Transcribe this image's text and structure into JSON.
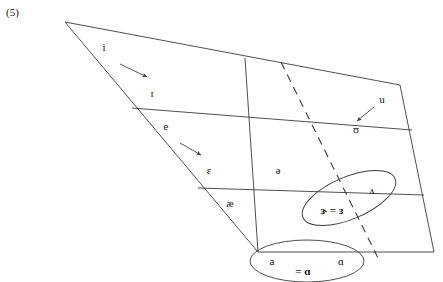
{
  "page": {
    "example_number": "(5)",
    "background_color": "#ffffff",
    "ink_color": "#333333",
    "width": 443,
    "height": 282
  },
  "diagram": {
    "type": "vowel-quadrilateral",
    "outline": {
      "top_left": [
        65,
        22
      ],
      "top_right": [
        400,
        85
      ],
      "bottom_right": [
        434,
        252
      ],
      "bottom_left": [
        258,
        252
      ]
    },
    "horizontal_lines": [
      {
        "name": "high-mid-line",
        "from": [
          132,
          108
        ],
        "to": [
          412,
          130
        ]
      },
      {
        "name": "mid-low-line",
        "from": [
          198,
          188
        ],
        "to": [
          424,
          195
        ]
      }
    ],
    "vertical_lines": [
      {
        "name": "central-line",
        "from": [
          245,
          58
        ],
        "to": [
          258,
          252
        ],
        "style": "solid"
      },
      {
        "name": "back-line",
        "from": [
          281,
          62
        ],
        "to": [
          380,
          262
        ],
        "style": "dashed"
      }
    ]
  },
  "labels": [
    {
      "name": "vowel-i",
      "text": "i",
      "x": 104,
      "y": 47
    },
    {
      "name": "vowel-small-cap-i",
      "text": "ɪ",
      "x": 152,
      "y": 93
    },
    {
      "name": "vowel-e",
      "text": "e",
      "x": 166,
      "y": 126
    },
    {
      "name": "vowel-epsilon",
      "text": "ɛ",
      "x": 209,
      "y": 170
    },
    {
      "name": "vowel-ash",
      "text": "æ",
      "x": 230,
      "y": 203
    },
    {
      "name": "vowel-schwa",
      "text": "ə",
      "x": 278,
      "y": 170
    },
    {
      "name": "vowel-u",
      "text": "u",
      "x": 382,
      "y": 99
    },
    {
      "name": "vowel-upsilon",
      "text": "ʊ",
      "x": 356,
      "y": 129
    },
    {
      "name": "vowel-wedge",
      "text": "ʌ",
      "x": 372,
      "y": 190
    },
    {
      "name": "vowel-a",
      "text": "a",
      "x": 272,
      "y": 261
    },
    {
      "name": "vowel-script-a",
      "text": "ɑ",
      "x": 341,
      "y": 261
    }
  ],
  "merge_labels": [
    {
      "name": "merger-nurse",
      "text": "ɝ = ɜ",
      "x": 332,
      "y": 210
    },
    {
      "name": "merger-low-back",
      "text": "= ɑ",
      "x": 303,
      "y": 271
    }
  ],
  "ellipses": [
    {
      "name": "nurse-merger-ellipse",
      "cx": 349,
      "cy": 198,
      "rx": 50,
      "ry": 21,
      "rotation": -23
    },
    {
      "name": "low-back-merger-ellipse",
      "cx": 307,
      "cy": 261,
      "rx": 57,
      "ry": 21,
      "rotation": 0
    }
  ],
  "arrows": [
    {
      "name": "shift-arrow-i-to-small-cap-i",
      "from": [
        120,
        64
      ],
      "to": [
        147,
        77
      ]
    },
    {
      "name": "shift-arrow-e-to-epsilon",
      "from": [
        180,
        143
      ],
      "to": [
        201,
        155
      ]
    },
    {
      "name": "shift-arrow-u-to-upsilon",
      "from": [
        374,
        107
      ],
      "to": [
        357,
        121
      ]
    }
  ]
}
